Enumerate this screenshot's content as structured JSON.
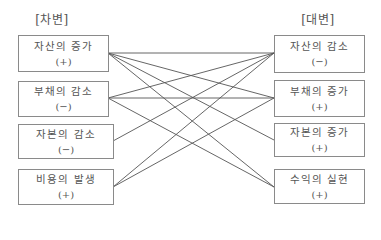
{
  "debit": {
    "header": "[차변]",
    "items": [
      {
        "label": "자산의 증가",
        "sign": "(+)"
      },
      {
        "label": "부채의 감소",
        "sign": "(−)"
      },
      {
        "label": "자본의 감소",
        "sign": "(−)"
      },
      {
        "label": "비용의 발생",
        "sign": "(+)"
      }
    ]
  },
  "credit": {
    "header": "[대변]",
    "items": [
      {
        "label": "자산의 감소",
        "sign": "(−)"
      },
      {
        "label": "부채의 증가",
        "sign": "(+)"
      },
      {
        "label": "자본의 증가",
        "sign": "(+)"
      },
      {
        "label": "수익의 실현",
        "sign": "(+)"
      }
    ]
  },
  "connections": [
    {
      "from": "자산의 증가",
      "to": "자산의 감소"
    },
    {
      "from": "자산의 증가",
      "to": "부채의 증가"
    },
    {
      "from": "자산의 증가",
      "to": "자본의 증가"
    },
    {
      "from": "자산의 증가",
      "to": "수익의 실현"
    },
    {
      "from": "부채의 감소",
      "to": "자산의 감소"
    },
    {
      "from": "부채의 감소",
      "to": "부채의 증가"
    },
    {
      "from": "부채의 감소",
      "to": "수익의 실현"
    },
    {
      "from": "자본의 감소",
      "to": "자산의 감소"
    },
    {
      "from": "비용의 발생",
      "to": "자산의 감소"
    },
    {
      "from": "비용의 발생",
      "to": "부채의 증가"
    }
  ]
}
